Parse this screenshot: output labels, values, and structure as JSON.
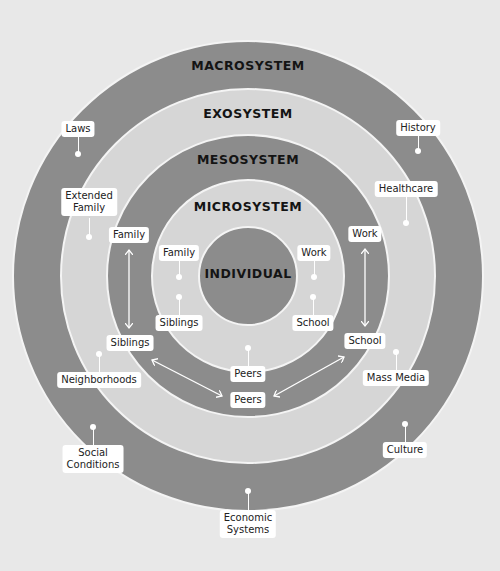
{
  "colors": {
    "background": "#e8e8e8",
    "macrosystem": "#8c8c8c",
    "exosystem": "#d6d6d6",
    "mesosystem": "#8c8c8c",
    "microsystem": "#d6d6d6",
    "individual": "#8c8c8c",
    "label_bg": "#ffffff",
    "title_text": "#141414"
  },
  "rings": {
    "macrosystem": "MACROSYSTEM",
    "exosystem": "EXOSYSTEM",
    "mesosystem": "MESOSYSTEM",
    "microsystem": "MICROSYSTEM",
    "individual": "INDIVIDUAL"
  },
  "macrosystem_labels": {
    "laws": "Laws",
    "history": "History",
    "social_conditions_1": "Social",
    "social_conditions_2": "Conditions",
    "culture": "Culture",
    "economic_systems_1": "Economic",
    "economic_systems_2": "Systems"
  },
  "exosystem_labels": {
    "extended_family_1": "Extended",
    "extended_family_2": "Family",
    "healthcare": "Healthcare",
    "neighborhoods": "Neighborhoods",
    "mass_media": "Mass Media"
  },
  "mesosystem_labels": {
    "family": "Family",
    "siblings": "Siblings",
    "work": "Work",
    "school": "School",
    "peers": "Peers"
  },
  "microsystem_labels": {
    "family": "Family",
    "siblings": "Siblings",
    "work": "Work",
    "school": "School",
    "peers": "Peers"
  }
}
